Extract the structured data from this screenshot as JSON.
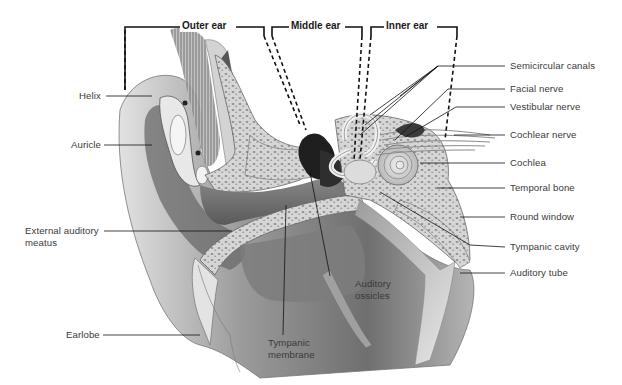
{
  "diagram": {
    "type": "anatomical-cross-section",
    "regions": [
      {
        "label": "Outer ear"
      },
      {
        "label": "Middle ear"
      },
      {
        "label": "Inner ear"
      }
    ],
    "labels_left": [
      {
        "label": "Helix"
      },
      {
        "label": "Auricle"
      },
      {
        "label": "External auditory"
      },
      {
        "label": "meatus"
      },
      {
        "label": "Earlobe"
      }
    ],
    "labels_right": [
      {
        "label": "Semicircular canals"
      },
      {
        "label": "Facial nerve"
      },
      {
        "label": "Vestibular nerve"
      },
      {
        "label": "Cochlear nerve"
      },
      {
        "label": "Cochlea"
      },
      {
        "label": "Temporal bone"
      },
      {
        "label": "Round window"
      },
      {
        "label": "Tympanic cavity"
      },
      {
        "label": "Auditory tube"
      }
    ],
    "labels_bottom": [
      {
        "label": "Auditory"
      },
      {
        "label": "ossicles"
      },
      {
        "label": "Tympanic"
      },
      {
        "label": "membrane"
      }
    ],
    "colors": {
      "line": "#1a1a1a",
      "text": "#3a3a3a",
      "skin_dark": "#6e6e6e",
      "skin_mid": "#a8a8a8",
      "skin_light": "#d8d8d8",
      "bone": "#cfcfcf",
      "bone_speckle": "#8a8a8a",
      "background": "#ffffff"
    }
  }
}
